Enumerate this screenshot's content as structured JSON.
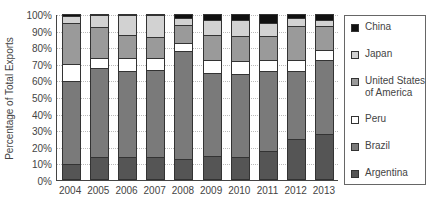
{
  "chart_data": {
    "type": "bar",
    "stacked": true,
    "title": "",
    "xlabel": "",
    "ylabel": "Percentage of Total Exports",
    "ylim": [
      0,
      100
    ],
    "yticks": [
      "0%",
      "10%",
      "20%",
      "30%",
      "40%",
      "50%",
      "60%",
      "70%",
      "80%",
      "90%",
      "100%"
    ],
    "grid": true,
    "legend_position": "right",
    "categories": [
      "2004",
      "2005",
      "2006",
      "2007",
      "2008",
      "2009",
      "2010",
      "2011",
      "2012",
      "2013"
    ],
    "series": [
      {
        "name": "Argentina",
        "color": "#555555",
        "values": [
          9,
          13,
          13,
          13,
          12,
          14,
          13,
          17,
          24,
          27
        ]
      },
      {
        "name": "Brazil",
        "color": "#7a7a7a",
        "values": [
          50,
          54,
          52,
          53,
          65,
          50,
          50,
          48,
          41,
          45
        ]
      },
      {
        "name": "Peru",
        "color": "#ffffff",
        "values": [
          10,
          6,
          8,
          7,
          5,
          8,
          8,
          7,
          7,
          6
        ]
      },
      {
        "name": "United States of America",
        "color": "#9a9a9a",
        "values": [
          25,
          19,
          14,
          13,
          11,
          15,
          15,
          14,
          20,
          14
        ]
      },
      {
        "name": "Japan",
        "color": "#d2d2d2",
        "values": [
          4,
          7,
          12,
          13,
          4,
          9,
          10,
          8,
          5,
          4
        ]
      },
      {
        "name": "China",
        "color": "#111111",
        "values": [
          2,
          1,
          1,
          1,
          3,
          4,
          4,
          6,
          3,
          4
        ]
      }
    ],
    "legend": [
      {
        "label": "China",
        "color": "#111111"
      },
      {
        "label": "Japan",
        "color": "#d2d2d2"
      },
      {
        "label": "United States\nof America",
        "color": "#9a9a9a"
      },
      {
        "label": "Peru",
        "color": "#ffffff"
      },
      {
        "label": "Brazil",
        "color": "#7a7a7a"
      },
      {
        "label": "Argentina",
        "color": "#555555"
      }
    ]
  }
}
